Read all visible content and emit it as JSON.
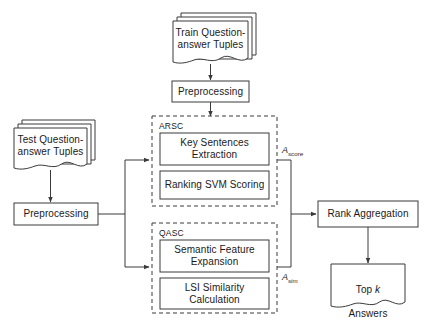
{
  "diagram": {
    "colors": {
      "stroke": "#3a3a3a",
      "text": "#1a1a1a",
      "background": "#ffffff",
      "dashed_stroke": "#3a3a3a"
    },
    "nodes": {
      "train_tuples": {
        "label": "Train  Question-\nanswer Tuples",
        "shape": "stacked-document"
      },
      "train_preprocessing": {
        "label": "Preprocessing",
        "shape": "rectangle"
      },
      "test_tuples": {
        "label": "Test  Question-\nanswer Tuples",
        "shape": "stacked-document"
      },
      "test_preprocessing": {
        "label": "Preprocessing",
        "shape": "rectangle"
      },
      "key_sentences_extraction": {
        "label": "Key Sentences\nExtraction",
        "shape": "rectangle"
      },
      "ranking_svm_scoring": {
        "label": "Ranking SVM Scoring",
        "shape": "rectangle"
      },
      "semantic_feature_expansion": {
        "label": "Semantic Feature\nExpansion",
        "shape": "rectangle"
      },
      "lsi_similarity_calculation": {
        "label": "LSI Similarity\nCalculation",
        "shape": "rectangle"
      },
      "rank_aggregation": {
        "label": "Rank Aggregation",
        "shape": "rectangle"
      },
      "top_k_answers": {
        "label_line1_prefix": "Top ",
        "label_line1_italic": "k",
        "label_line2": "Answers",
        "shape": "document"
      }
    },
    "groups": {
      "arsc": {
        "title": "ARSC",
        "style": "dashed"
      },
      "qasc": {
        "title": "QASC",
        "style": "dashed"
      }
    },
    "edge_labels": {
      "a_score": {
        "base": "A",
        "subscript": "score"
      },
      "a_sim": {
        "base": "A",
        "subscript": "sim"
      }
    }
  }
}
